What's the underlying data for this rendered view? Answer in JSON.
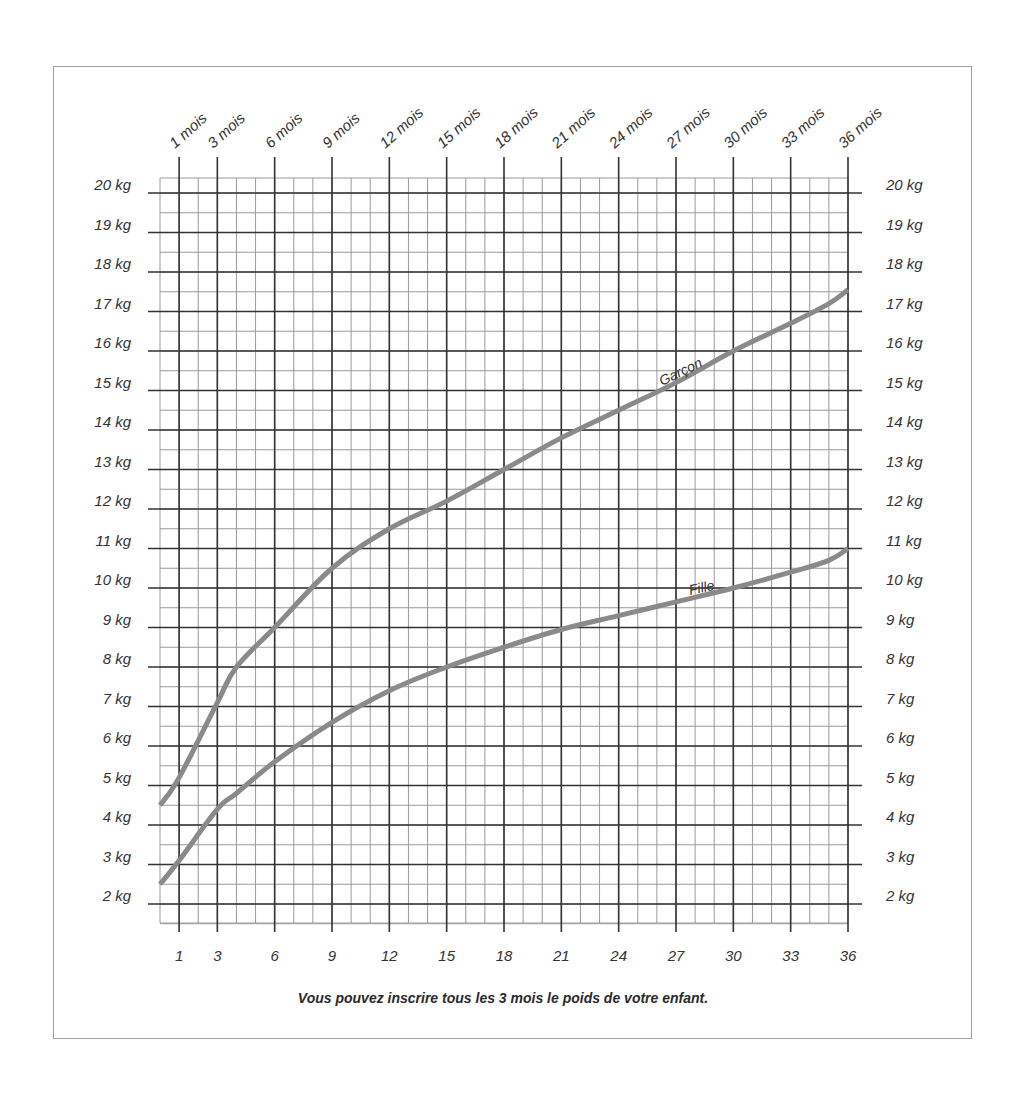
{
  "chart_data": {
    "type": "line",
    "title": "",
    "xlabel": "Âge (mois)",
    "ylabel": "Poids (kg)",
    "xlim": [
      0,
      36
    ],
    "ylim": [
      1.5,
      20.5
    ],
    "grid": true,
    "x_ticks_top": [
      "1 mois",
      "3 mois",
      "6 mois",
      "9 mois",
      "12 mois",
      "15 mois",
      "18 mois",
      "21 mois",
      "24 mois",
      "27 mois",
      "30 mois",
      "33 mois",
      "36 mois"
    ],
    "x_ticks_bottom": [
      "1",
      "3",
      "6",
      "9",
      "12",
      "15",
      "18",
      "21",
      "24",
      "27",
      "30",
      "33",
      "36"
    ],
    "x_tick_values": [
      1,
      3,
      6,
      9,
      12,
      15,
      18,
      21,
      24,
      27,
      30,
      33,
      36
    ],
    "y_ticks": [
      "20 kg",
      "19 kg",
      "18 kg",
      "17 kg",
      "16 kg",
      "15 kg",
      "14 kg",
      "13 kg",
      "12 kg",
      "11 kg",
      "10 kg",
      "9 kg",
      "8 kg",
      "7 kg",
      "6 kg",
      "5 kg",
      "4 kg",
      "3 kg",
      "2 kg"
    ],
    "y_tick_values": [
      20,
      19,
      18,
      17,
      16,
      15,
      14,
      13,
      12,
      11,
      10,
      9,
      8,
      7,
      6,
      5,
      4,
      3,
      2
    ],
    "x": [
      0,
      1,
      3,
      4,
      6,
      9,
      12,
      15,
      18,
      21,
      24,
      27,
      30,
      33,
      35,
      36
    ],
    "series": [
      {
        "name": "Garçon",
        "color": "#8a8a8a",
        "values": [
          4.5,
          5.2,
          7.1,
          8.0,
          9.0,
          10.5,
          11.5,
          12.2,
          13.0,
          13.8,
          14.5,
          15.2,
          16.0,
          16.7,
          17.2,
          17.55
        ]
      },
      {
        "name": "Fille",
        "color": "#8a8a8a",
        "values": [
          2.5,
          3.1,
          4.4,
          4.8,
          5.6,
          6.6,
          7.4,
          8.0,
          8.5,
          8.95,
          9.3,
          9.65,
          10.0,
          10.4,
          10.7,
          11.0
        ]
      }
    ],
    "annotations": [
      "Garçon",
      "Fille"
    ],
    "caption": "Vous pouvez inscrire tous les 3 mois le poids de votre enfant."
  },
  "caption": "Vous pouvez inscrire tous les 3 mois le poids de votre enfant.",
  "colors": {
    "major_grid": "#333333",
    "minor_grid": "#9a9a9a",
    "curve": "#8a8a8a",
    "frame": "#a0a0a0",
    "text": "#333333"
  }
}
